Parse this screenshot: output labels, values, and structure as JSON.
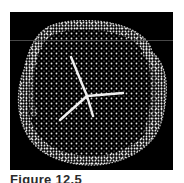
{
  "figure": {
    "caption": "Figure 12.5",
    "background_color": "#000000",
    "dot_color": "#e8e8e8",
    "mark_color": "#f2f2f2"
  }
}
